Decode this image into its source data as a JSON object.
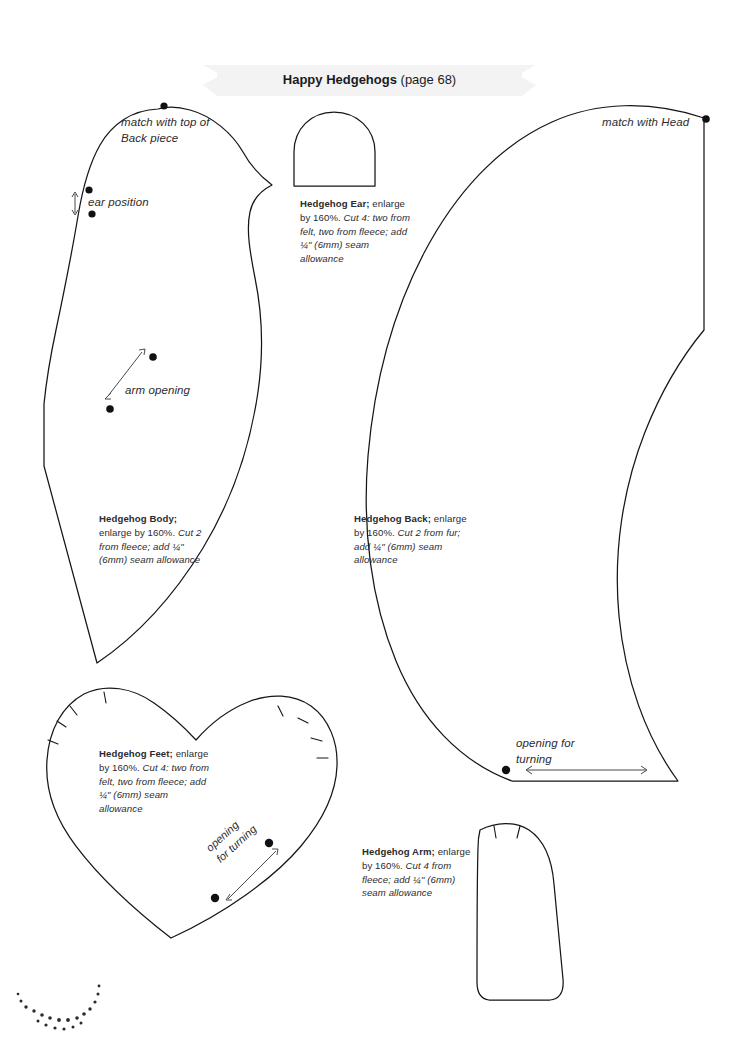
{
  "page": {
    "title_bold": "Happy Hedgehogs",
    "title_ref": "(page 68)",
    "folio": "120",
    "background_color": "#ffffff",
    "ink_color": "#231f20"
  },
  "pieces": {
    "body": {
      "name": "Hedgehog Body",
      "caption_title": "Hedgehog Body;",
      "caption_rest": " enlarge by 160%. ",
      "caption_italic": "Cut 2 from fleece; add ¼\" (6mm) seam allowance",
      "labels": {
        "match": "match with top of Back piece",
        "ear_position": "ear position",
        "arm_opening": "arm opening"
      }
    },
    "ear": {
      "name": "Hedgehog Ear",
      "caption_title": "Hedgehog Ear;",
      "caption_rest": " enlarge by 160%. ",
      "caption_italic": "Cut 4: two from felt, two from fleece; add ¼\" (6mm) seam allowance"
    },
    "back": {
      "name": "Hedgehog Back",
      "caption_title": "Hedgehog Back;",
      "caption_rest": " enlarge by 160%. ",
      "caption_italic": "Cut 2 from fur; add ¼\" (6mm) seam allowance",
      "labels": {
        "match": "match with Head",
        "opening": "opening for turning"
      }
    },
    "feet": {
      "name": "Hedgehog Feet",
      "caption_title": "Hedgehog Feet;",
      "caption_rest": " enlarge by 160%. ",
      "caption_italic": "Cut 4: two from felt, two from fleece; add ¼\" (6mm) seam allowance",
      "labels": {
        "opening_line1": "opening",
        "opening_line2": "for turning"
      }
    },
    "arm": {
      "name": "Hedgehog Arm",
      "caption_title": "Hedgehog Arm;",
      "caption_rest": " enlarge by 160%. ",
      "caption_italic": "Cut 4 from fleece; add ¼\" (6mm) seam allowance"
    }
  }
}
